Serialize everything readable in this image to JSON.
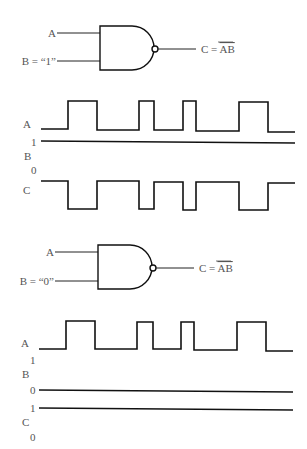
{
  "diagrams": [
    {
      "gate": {
        "type": "NAND",
        "input_a_label": "A",
        "input_b_label": "B = “1”",
        "output_label_prefix": "C = ",
        "output_label_expr": "AB"
      },
      "timing": {
        "signal_a_label": "A",
        "signal_b_label": "B",
        "signal_b_high": "1",
        "signal_b_low": "0",
        "signal_c_label": "C",
        "a_edges_x": [
          68,
          97,
          139,
          154,
          183,
          196,
          239,
          268
        ],
        "b_level": "1",
        "c_behavior": "inverted A"
      }
    },
    {
      "gate": {
        "type": "NAND",
        "input_a_label": "A",
        "input_b_label": "B = “0”",
        "output_label_prefix": "C = ",
        "output_label_expr": "AB"
      },
      "timing": {
        "signal_a_label": "A",
        "signal_b_label": "B",
        "signal_b_high": "1",
        "signal_b_low": "0",
        "signal_c_label": "C",
        "signal_c_high": "1",
        "signal_c_low": "0",
        "a_edges_x": [
          66,
          95,
          137,
          153,
          181,
          194,
          237,
          266
        ],
        "b_level": "0",
        "c_level": "1"
      }
    }
  ]
}
